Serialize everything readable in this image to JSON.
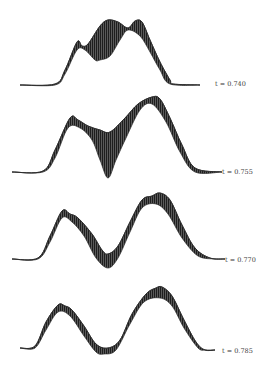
{
  "figure": {
    "panels": [
      {
        "label": "t = 0.740",
        "label_x": 215,
        "label_y": 80
      },
      {
        "label": "t = 0.755",
        "label_x": 222,
        "label_y": 168
      },
      {
        "label": "t = 0.770",
        "label_x": 225,
        "label_y": 256
      },
      {
        "label": "t = 0.785",
        "label_x": 222,
        "label_y": 347
      }
    ],
    "colors": {
      "ink": "#2a2a2a",
      "hatch": "#4a4a4a",
      "background": "#ffffff"
    }
  },
  "chart_data": {
    "type": "area",
    "title": "",
    "xlabel": "",
    "ylabel": "",
    "grid": false,
    "legend": "none",
    "series": [
      {
        "name": "t = 0.740",
        "t": 0.74,
        "upper": [
          [
            20,
            85
          ],
          [
            55,
            84
          ],
          [
            65,
            70
          ],
          [
            77,
            42
          ],
          [
            82,
            46
          ],
          [
            88,
            44
          ],
          [
            100,
            26
          ],
          [
            108,
            20
          ],
          [
            118,
            22
          ],
          [
            128,
            28
          ],
          [
            135,
            21
          ],
          [
            142,
            22
          ],
          [
            150,
            40
          ],
          [
            160,
            62
          ],
          [
            170,
            80
          ],
          [
            173,
            84
          ],
          [
            200,
            85
          ]
        ],
        "lower": [
          [
            20,
            85
          ],
          [
            55,
            85
          ],
          [
            65,
            74
          ],
          [
            77,
            50
          ],
          [
            85,
            50
          ],
          [
            95,
            60
          ],
          [
            100,
            60
          ],
          [
            110,
            56
          ],
          [
            120,
            40
          ],
          [
            128,
            30
          ],
          [
            140,
            36
          ],
          [
            150,
            52
          ],
          [
            160,
            70
          ],
          [
            170,
            84
          ],
          [
            200,
            85
          ]
        ]
      },
      {
        "name": "t = 0.755",
        "t": 0.755,
        "upper": [
          [
            12,
            172
          ],
          [
            43,
            171
          ],
          [
            55,
            150
          ],
          [
            70,
            118
          ],
          [
            78,
            120
          ],
          [
            88,
            126
          ],
          [
            100,
            130
          ],
          [
            110,
            132
          ],
          [
            125,
            118
          ],
          [
            138,
            104
          ],
          [
            152,
            97
          ],
          [
            160,
            99
          ],
          [
            170,
            118
          ],
          [
            182,
            145
          ],
          [
            195,
            168
          ],
          [
            222,
            172
          ]
        ],
        "lower": [
          [
            12,
            172
          ],
          [
            43,
            172
          ],
          [
            55,
            158
          ],
          [
            68,
            128
          ],
          [
            80,
            128
          ],
          [
            92,
            140
          ],
          [
            100,
            160
          ],
          [
            108,
            178
          ],
          [
            116,
            160
          ],
          [
            126,
            138
          ],
          [
            140,
            110
          ],
          [
            152,
            104
          ],
          [
            166,
            122
          ],
          [
            180,
            152
          ],
          [
            195,
            172
          ],
          [
            222,
            172
          ]
        ]
      },
      {
        "name": "t = 0.770",
        "t": 0.77,
        "upper": [
          [
            12,
            259
          ],
          [
            38,
            258
          ],
          [
            50,
            236
          ],
          [
            62,
            211
          ],
          [
            70,
            214
          ],
          [
            78,
            218
          ],
          [
            92,
            234
          ],
          [
            102,
            250
          ],
          [
            108,
            254
          ],
          [
            118,
            246
          ],
          [
            130,
            222
          ],
          [
            142,
            200
          ],
          [
            152,
            196
          ],
          [
            160,
            193
          ],
          [
            170,
            200
          ],
          [
            182,
            225
          ],
          [
            195,
            248
          ],
          [
            210,
            258
          ],
          [
            225,
            259
          ]
        ],
        "lower": [
          [
            12,
            259
          ],
          [
            38,
            259
          ],
          [
            50,
            242
          ],
          [
            62,
            218
          ],
          [
            72,
            222
          ],
          [
            84,
            236
          ],
          [
            96,
            258
          ],
          [
            108,
            268
          ],
          [
            118,
            258
          ],
          [
            130,
            232
          ],
          [
            142,
            208
          ],
          [
            156,
            204
          ],
          [
            168,
            214
          ],
          [
            182,
            238
          ],
          [
            198,
            256
          ],
          [
            215,
            259
          ]
        ]
      },
      {
        "name": "t = 0.785",
        "t": 0.785,
        "upper": [
          [
            20,
            348
          ],
          [
            35,
            346
          ],
          [
            46,
            322
          ],
          [
            58,
            305
          ],
          [
            65,
            306
          ],
          [
            72,
            310
          ],
          [
            84,
            326
          ],
          [
            96,
            344
          ],
          [
            108,
            348
          ],
          [
            120,
            340
          ],
          [
            132,
            314
          ],
          [
            146,
            294
          ],
          [
            156,
            288
          ],
          [
            162,
            287
          ],
          [
            172,
            296
          ],
          [
            184,
            320
          ],
          [
            196,
            342
          ],
          [
            205,
            350
          ],
          [
            215,
            350
          ]
        ],
        "lower": [
          [
            20,
            348
          ],
          [
            35,
            348
          ],
          [
            46,
            330
          ],
          [
            58,
            312
          ],
          [
            70,
            316
          ],
          [
            84,
            336
          ],
          [
            96,
            352
          ],
          [
            104,
            354
          ],
          [
            116,
            350
          ],
          [
            130,
            324
          ],
          [
            144,
            302
          ],
          [
            160,
            298
          ],
          [
            172,
            306
          ],
          [
            184,
            328
          ],
          [
            198,
            348
          ],
          [
            205,
            350
          ]
        ]
      }
    ]
  }
}
